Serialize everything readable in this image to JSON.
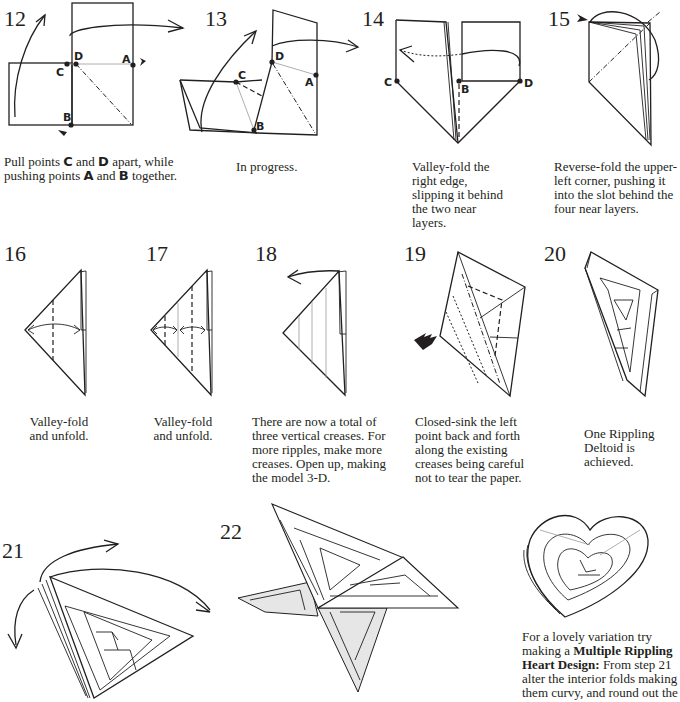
{
  "steps": [
    {
      "number": "12",
      "caption_parts": [
        "Pull points ",
        "C",
        " and ",
        "D",
        " apart, while pushing points ",
        "A",
        " and ",
        "B",
        " together."
      ],
      "points": [
        "A",
        "B",
        "C",
        "D"
      ]
    },
    {
      "number": "13",
      "caption": "In progress.",
      "points": [
        "A",
        "B",
        "C",
        "D"
      ]
    },
    {
      "number": "14",
      "caption": "Valley-fold the right edge, slipping it behind the two near layers.",
      "points": [
        "B",
        "C",
        "D"
      ]
    },
    {
      "number": "15",
      "caption": "Reverse-fold the upper-left corner, pushing it into the slot behind the four near layers."
    },
    {
      "number": "16",
      "caption": "Valley-fold and unfold."
    },
    {
      "number": "17",
      "caption": "Valley-fold and unfold."
    },
    {
      "number": "18",
      "caption": "There are now a total of three vertical creases. For more ripples, make more creases.  Open up, making the model 3-D."
    },
    {
      "number": "19",
      "caption": "Closed-sink the left point back and forth along the existing creases being careful not to tear the paper."
    },
    {
      "number": "20",
      "caption": "One Rippling Deltoid is achieved."
    },
    {
      "number": "21"
    },
    {
      "number": "22"
    }
  ],
  "variation": {
    "lead": "For a lovely variation try making a ",
    "bold": "Multiple Rippling Heart Design:",
    "rest": "  From step 21 alter the interior folds making them curvy, and round out the"
  },
  "icons": [
    "arrow-curved-icon",
    "push-arrow-icon",
    "sink-arrow-icon",
    "unfold-double-arrow-icon"
  ]
}
